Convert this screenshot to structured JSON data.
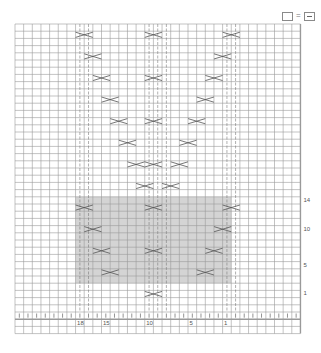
{
  "legend": {
    "knit_symbol": "empty-square",
    "equals": "=",
    "purl_symbol": "square-with-dash"
  },
  "grid": {
    "columns": 33,
    "rows": 42,
    "left": 15,
    "top": 24,
    "cell_w": 8.65,
    "cell_h": 7.2,
    "line_color": "#9a9a9a",
    "shade_color": "#d4d4d4",
    "shade": {
      "col_start": 7,
      "col_end": 25,
      "row_start": 24,
      "row_end": 36
    },
    "thick_right_col": 33
  },
  "stitch_labels": [
    {
      "text": "18",
      "col": 7
    },
    {
      "text": "15",
      "col": 10
    },
    {
      "text": "10",
      "col": 15
    },
    {
      "text": "5",
      "col": 20
    },
    {
      "text": "1",
      "col": 24
    }
  ],
  "row_labels": [
    {
      "text": "14",
      "row": 24
    },
    {
      "text": "10",
      "row": 28
    },
    {
      "text": "5",
      "row": 33
    },
    {
      "text": "1",
      "row": 37
    }
  ],
  "dashed_columns": [
    7,
    8,
    15,
    16,
    17,
    24,
    25
  ],
  "cables": [
    {
      "row": 1,
      "col": 7
    },
    {
      "row": 4,
      "col": 8
    },
    {
      "row": 7,
      "col": 9
    },
    {
      "row": 10,
      "col": 10
    },
    {
      "row": 13,
      "col": 11
    },
    {
      "row": 16,
      "col": 12
    },
    {
      "row": 19,
      "col": 13
    },
    {
      "row": 1,
      "col": 24
    },
    {
      "row": 4,
      "col": 23
    },
    {
      "row": 7,
      "col": 22
    },
    {
      "row": 10,
      "col": 21
    },
    {
      "row": 13,
      "col": 20
    },
    {
      "row": 16,
      "col": 19
    },
    {
      "row": 19,
      "col": 18
    },
    {
      "row": 1,
      "col": 15
    },
    {
      "row": 7,
      "col": 15
    },
    {
      "row": 13,
      "col": 15
    },
    {
      "row": 19,
      "col": 15
    },
    {
      "row": 22,
      "col": 14
    },
    {
      "row": 22,
      "col": 17
    },
    {
      "row": 25,
      "col": 7
    },
    {
      "row": 28,
      "col": 8
    },
    {
      "row": 31,
      "col": 9
    },
    {
      "row": 34,
      "col": 10
    },
    {
      "row": 25,
      "col": 24
    },
    {
      "row": 28,
      "col": 23
    },
    {
      "row": 31,
      "col": 22
    },
    {
      "row": 34,
      "col": 21
    },
    {
      "row": 25,
      "col": 15
    },
    {
      "row": 31,
      "col": 15
    },
    {
      "row": 37,
      "col": 15
    }
  ],
  "bottom_purl_row": 40
}
